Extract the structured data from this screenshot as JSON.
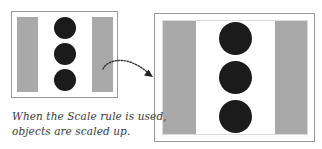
{
  "diagram": {
    "type": "before-after scale illustration",
    "original_panel": {
      "label": "original",
      "elements": [
        "gray-bar-left",
        "circle",
        "circle",
        "circle",
        "gray-bar-right"
      ],
      "circle_count": 3
    },
    "scaled_panel": {
      "label": "scaled",
      "elements": [
        "gray-bar-left",
        "circle",
        "circle",
        "circle",
        "gray-bar-right"
      ],
      "circle_count": 3
    },
    "arrow": {
      "style": "dotted-curved",
      "from": "original_panel",
      "to": "scaled_panel"
    },
    "caption": {
      "line1": "When the Scale rule is used,",
      "line2": "objects are scaled up."
    },
    "colors": {
      "frame_border": "#9a9a9a",
      "bar": "#a9a9a9",
      "circle": "#1b1b1b",
      "caption_text": "#3a3a3a",
      "arrow": "#333333"
    }
  }
}
